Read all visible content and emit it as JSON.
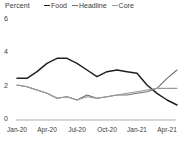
{
  "chart_data": {
    "type": "line",
    "title": "",
    "subtitle": "",
    "xlabel": "",
    "ylabel": "Percent",
    "ylim": [
      0,
      6
    ],
    "yticks": [
      0,
      2,
      4,
      6
    ],
    "ytick_labels": [
      "0",
      "2",
      "4",
      "6"
    ],
    "xtick_labels": [
      "Jan-20",
      "Apr-20",
      "Jul-20",
      "Oct-20",
      "Jan-21",
      "Apr-21"
    ],
    "xtick_positions": [
      0,
      3,
      6,
      9,
      12,
      15
    ],
    "xlim": [
      0,
      16
    ],
    "grid": false,
    "legend_position": "top",
    "x": [
      0,
      1,
      2,
      3,
      4,
      5,
      6,
      7,
      8,
      9,
      10,
      11,
      12,
      13,
      14,
      15,
      16
    ],
    "series": [
      {
        "name": "Food",
        "color": "#231f20",
        "values": [
          2.5,
          2.5,
          2.9,
          3.4,
          3.7,
          3.7,
          3.4,
          3.0,
          2.6,
          2.9,
          3.0,
          2.9,
          2.8,
          2.1,
          1.6,
          1.2,
          0.9
        ]
      },
      {
        "name": "Headline",
        "color": "#6f6f6f",
        "values": [
          2.1,
          2.0,
          1.8,
          1.6,
          1.3,
          1.4,
          1.2,
          1.5,
          1.3,
          1.4,
          1.5,
          1.5,
          1.6,
          1.7,
          1.9,
          2.5,
          3.0
        ]
      },
      {
        "name": "Core",
        "color": "#9a9a9a",
        "values": [
          2.1,
          2.0,
          1.8,
          1.6,
          1.3,
          1.4,
          1.2,
          1.4,
          1.3,
          1.4,
          1.5,
          1.6,
          1.7,
          1.8,
          1.9,
          1.9,
          1.9
        ]
      }
    ]
  },
  "legend": {
    "unit_label": "Percent",
    "entries": [
      {
        "label": "Food",
        "color": "#231f20"
      },
      {
        "label": "Headline",
        "color": "#6f6f6f"
      },
      {
        "label": "Core",
        "color": "#9a9a9a"
      }
    ]
  },
  "axis": {
    "baseline_color": "#8c8c8c"
  }
}
